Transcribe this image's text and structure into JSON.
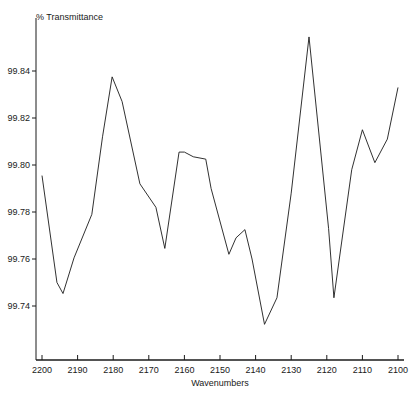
{
  "chart_data": {
    "type": "line",
    "title": "",
    "subtitle": "",
    "xlabel": "Wavenumbers",
    "ylabel": "% Transmittance",
    "xlim": [
      2200,
      2100
    ],
    "ylim": [
      99.7265,
      99.8585
    ],
    "x_inverted": true,
    "grid": false,
    "legend": null,
    "legend_position": "none",
    "xticks": [
      2200,
      2190,
      2180,
      2170,
      2160,
      2150,
      2140,
      2130,
      2120,
      2110,
      2100
    ],
    "xtick_labels": [
      "2200",
      "2190",
      "2180",
      "2170",
      "2160",
      "2150",
      "2140",
      "2130",
      "2120",
      "2110",
      "2100"
    ],
    "yticks": [
      99.74,
      99.76,
      99.78,
      99.8,
      99.82,
      99.84
    ],
    "ytick_labels": [
      "99.74",
      "99.76",
      "99.78",
      "99.80",
      "99.82",
      "99.84"
    ],
    "series": [
      {
        "name": "transmittance",
        "color": "#1a1a1a",
        "x": [
          2200.0,
          2195.8,
          2194.1,
          2191.0,
          2186.0,
          2183.0,
          2180.3,
          2177.5,
          2172.5,
          2168.0,
          2165.5,
          2161.5,
          2160.0,
          2157.5,
          2154.0,
          2152.5,
          2147.5,
          2145.5,
          2143.0,
          2141.0,
          2137.5,
          2134.0,
          2130.0,
          2125.0,
          2119.5,
          2118.0,
          2113.0,
          2110.0,
          2106.5,
          2103.0,
          2100.0
        ],
        "y": [
          99.7955,
          99.75,
          99.7453,
          99.7605,
          99.779,
          99.812,
          99.8375,
          99.827,
          99.792,
          99.782,
          99.7645,
          99.8055,
          99.8055,
          99.8035,
          99.8025,
          99.79,
          99.762,
          99.769,
          99.7725,
          99.76,
          99.7322,
          99.7435,
          99.788,
          99.8545,
          99.773,
          99.7435,
          99.798,
          99.815,
          99.801,
          99.811,
          99.833
        ]
      }
    ]
  },
  "axes": {
    "y_axis_title": "% Transmittance",
    "x_axis_title": "Wavenumbers"
  }
}
